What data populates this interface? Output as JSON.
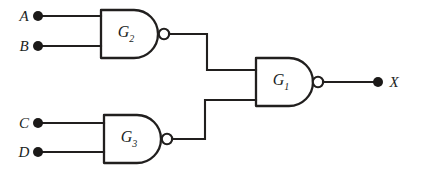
{
  "figure": {
    "name": "nand-logic-circuit",
    "background_color": "#ffffff",
    "ink_color": "#211f1e"
  },
  "inputs": [
    {
      "label": "A",
      "x": 38,
      "y": 16,
      "gate": "G2",
      "pin": "top"
    },
    {
      "label": "B",
      "x": 38,
      "y": 46,
      "gate": "G2",
      "pin": "bottom"
    },
    {
      "label": "C",
      "x": 38,
      "y": 123,
      "gate": "G3",
      "pin": "top"
    },
    {
      "label": "D",
      "x": 38,
      "y": 152,
      "gate": "G3",
      "pin": "bottom"
    }
  ],
  "gates": [
    {
      "id": "G2",
      "label": "G",
      "subscript": "2",
      "type": "nand",
      "label_x": 126,
      "label_y": 34
    },
    {
      "id": "G3",
      "label": "G",
      "subscript": "3",
      "type": "nand",
      "label_x": 129,
      "label_y": 139
    },
    {
      "id": "G1",
      "label": "G",
      "subscript": "1",
      "type": "nand",
      "label_x": 281,
      "label_y": 82
    }
  ],
  "outputs": [
    {
      "label": "X",
      "dot_x": 378,
      "dot_y": 82,
      "label_x": 393,
      "label_y": 82,
      "from_gate": "G1"
    }
  ],
  "connections": [
    {
      "from": "A",
      "to": "G2.in1"
    },
    {
      "from": "B",
      "to": "G2.in2"
    },
    {
      "from": "C",
      "to": "G3.in1"
    },
    {
      "from": "D",
      "to": "G3.in2"
    },
    {
      "from": "G2.out",
      "to": "G1.in1"
    },
    {
      "from": "G3.out",
      "to": "G1.in2"
    },
    {
      "from": "G1.out",
      "to": "X"
    }
  ]
}
